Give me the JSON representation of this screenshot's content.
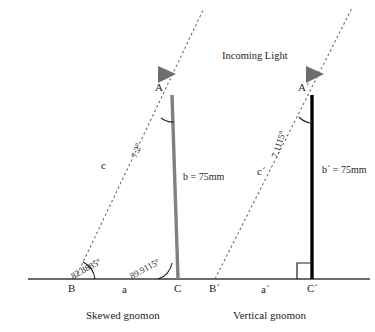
{
  "figure": {
    "title_text": "Incoming Light",
    "baseline": {
      "y": 279,
      "x1": 28,
      "x2": 370
    },
    "colors": {
      "skewed_gnomon": "#808080",
      "vertical_gnomon": "#000000",
      "ray": "#6b6b6b",
      "arrow": "#6e6e6e",
      "baseline": "#3a3a3a",
      "text": "#231f20"
    },
    "left": {
      "caption": "Skewed gnomon",
      "apex_label": "A",
      "base_label": "B",
      "foot_label": "C",
      "adjacent_label": "a",
      "hypotenuse_label": "c",
      "gnomon_label": "b = 75mm",
      "apex_angle": "7.2°",
      "base_angle": "82.8885°",
      "foot_angle": "89.9115°"
    },
    "right": {
      "caption": "Vertical gnomon",
      "apex_label": "A´",
      "base_label": "B´",
      "foot_label": "C´",
      "adjacent_label": "a´",
      "hypotenuse_label": "c´",
      "gnomon_label": "b´ = 75mm",
      "apex_angle": "7.1115°",
      "foot_angle_marker": "right-angle"
    }
  }
}
